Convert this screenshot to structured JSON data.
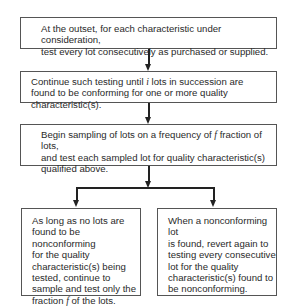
{
  "diagram": {
    "type": "flowchart",
    "boxes": [
      {
        "id": "step1",
        "lines": [
          "At the outset, for each characteristic under consideration,",
          "test every lot consecutively as purchased or supplied."
        ]
      },
      {
        "id": "step2",
        "lines_parts": {
          "l1_pre": "Continue such testing until ",
          "l1_var": "i",
          "l1_post": " lots in succession are",
          "l2": "found to be conforming for one or more quality characteristic(s)."
        }
      },
      {
        "id": "step3",
        "lines_parts": {
          "l1_pre": "Begin sampling of lots on a frequency of ",
          "l1_var": "f",
          "l1_post": " fraction of lots,",
          "l2": "and test each sampled lot for quality characteristic(s)",
          "l3": "qualified above."
        }
      },
      {
        "id": "branch_conforming",
        "lines": [
          "As long as no lots are",
          "found to be nonconforming",
          "for the quality",
          "characteristic(s) being",
          "tested, continue to",
          "sample and test only the"
        ],
        "last_pre": "fraction ",
        "last_var": "f",
        "last_post": " of the lots."
      },
      {
        "id": "branch_nonconforming",
        "lines": [
          "When a nonconforming lot",
          "is found, revert again to",
          "testing every consecutive",
          "lot for the quality",
          "characteristic(s) found to",
          "be nonconforming."
        ]
      }
    ],
    "edges": [
      {
        "from": "step1",
        "to": "step2"
      },
      {
        "from": "step2",
        "to": "step3"
      },
      {
        "from": "step3",
        "to": "branch_conforming"
      },
      {
        "from": "step3",
        "to": "branch_nonconforming"
      }
    ]
  }
}
